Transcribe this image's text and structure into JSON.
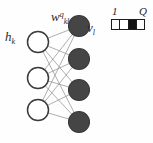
{
  "figure": {
    "background_color": "#fefefe"
  },
  "labels": {
    "hidden_layer": {
      "base": "h",
      "sub": "k"
    },
    "visible_layer": {
      "base": "v",
      "sub": "l"
    },
    "weight": {
      "base": "w",
      "sup": "q",
      "sub": "kl"
    }
  },
  "legend": {
    "min_label": "1",
    "max_label": "Q",
    "cells": [
      {
        "index": 1,
        "filled": false
      },
      {
        "index": 2,
        "filled": false
      },
      {
        "index": 3,
        "filled": true
      },
      {
        "index": 4,
        "filled": false
      }
    ],
    "fill_color": "#121212",
    "empty_color": "#ffffff",
    "border_color": "#1d1d1d"
  },
  "graph": {
    "edge_color": "#8d8d8d",
    "hidden_node_fill": "#ffffff",
    "hidden_node_stroke": "#3a3a3a",
    "visible_node_fill": "#454545",
    "visible_node_stroke": "#3a3a3a",
    "hidden_nodes": [
      {
        "id": "h1",
        "cx": 38,
        "cy": 42,
        "r": 10.5
      },
      {
        "id": "h2",
        "cx": 38,
        "cy": 78,
        "r": 10.5
      },
      {
        "id": "h3",
        "cx": 38,
        "cy": 110,
        "r": 10.5
      }
    ],
    "visible_nodes": [
      {
        "id": "v1",
        "cx": 79,
        "cy": 26,
        "r": 10.5
      },
      {
        "id": "v2",
        "cx": 79,
        "cy": 59,
        "r": 10.5
      },
      {
        "id": "v3",
        "cx": 79,
        "cy": 90,
        "r": 10.5
      },
      {
        "id": "v4",
        "cx": 79,
        "cy": 122,
        "r": 10.5
      }
    ],
    "edges": [
      {
        "from": "h1",
        "to": "v1"
      },
      {
        "from": "h1",
        "to": "v2"
      },
      {
        "from": "h1",
        "to": "v3"
      },
      {
        "from": "h1",
        "to": "v4"
      },
      {
        "from": "h2",
        "to": "v1"
      },
      {
        "from": "h2",
        "to": "v2"
      },
      {
        "from": "h2",
        "to": "v3"
      },
      {
        "from": "h2",
        "to": "v4"
      },
      {
        "from": "h3",
        "to": "v1"
      },
      {
        "from": "h3",
        "to": "v2"
      },
      {
        "from": "h3",
        "to": "v3"
      },
      {
        "from": "h3",
        "to": "v4"
      }
    ]
  }
}
